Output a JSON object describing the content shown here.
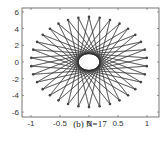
{
  "chart_data": {
    "type": "line",
    "title": "",
    "caption": "(b) N=17",
    "xlabel": "",
    "ylabel": "",
    "xlim": [
      -1.2,
      1.2
    ],
    "ylim": [
      -6.6,
      6.6
    ],
    "xticks": [
      -1,
      -0.5,
      0,
      0.5,
      1
    ],
    "xtick_labels": [
      "-1",
      "-0.5",
      "0",
      "0.5",
      "1"
    ],
    "yticks": [
      6,
      4,
      2,
      0,
      -2,
      -4,
      -6
    ],
    "ytick_labels": [
      "6",
      "4",
      "2",
      "0",
      "-2",
      "-4",
      "-6"
    ],
    "grid": false,
    "legend": null,
    "N": 17,
    "num_points": 34,
    "ellipse_rx": 1.0,
    "ellipse_ry": 5.4,
    "chord_step": 15,
    "line_color": "#333333",
    "marker_color": "#444444"
  }
}
